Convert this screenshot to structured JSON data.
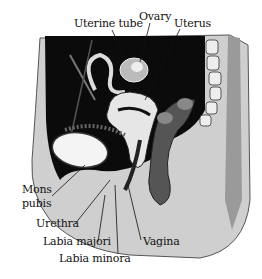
{
  "figure": {
    "labels": {
      "uterine_tube": "Uterine tube",
      "ovary": "Ovary",
      "uterus": "Uterus",
      "mons_pubis_1": "Mons",
      "mons_pubis_2": "pubis",
      "urethra": "Urethra",
      "labia_majori": "Labia majori",
      "labia_minora": "Labia minora",
      "vagina": "Vagina"
    }
  }
}
